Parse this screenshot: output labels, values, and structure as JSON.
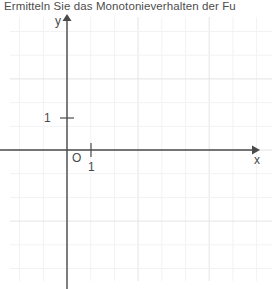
{
  "prompt": {
    "text": "Ermitteln Sie das Monotonieverhalten der Fu"
  },
  "chart_data": {
    "type": "scatter",
    "title": "",
    "xlabel": "x",
    "ylabel": "y",
    "x_axis_label": "x",
    "y_axis_label": "y",
    "origin_label": "O",
    "x_tick_labels": [
      "1"
    ],
    "x_tick_values": [
      1
    ],
    "y_tick_labels": [
      "1"
    ],
    "y_tick_values": [
      1
    ],
    "xlim": [
      -2.4,
      8.65
    ],
    "ylim": [
      -5.5,
      5.65
    ],
    "grid": true,
    "grid_spacing_units": 1,
    "grid_color": "#f2f2f4",
    "grid_major_color": "#e4e4e8",
    "axis_color": "#4a4a4a",
    "legend": "none",
    "series": [],
    "values": [],
    "categories": [],
    "annotations": []
  },
  "colors": {
    "background": "#ffffff",
    "text": "#4d4d4d",
    "axis": "#4a4a4a",
    "grid_minor": "#f2f2f4",
    "grid_major": "#e4e4e8"
  }
}
